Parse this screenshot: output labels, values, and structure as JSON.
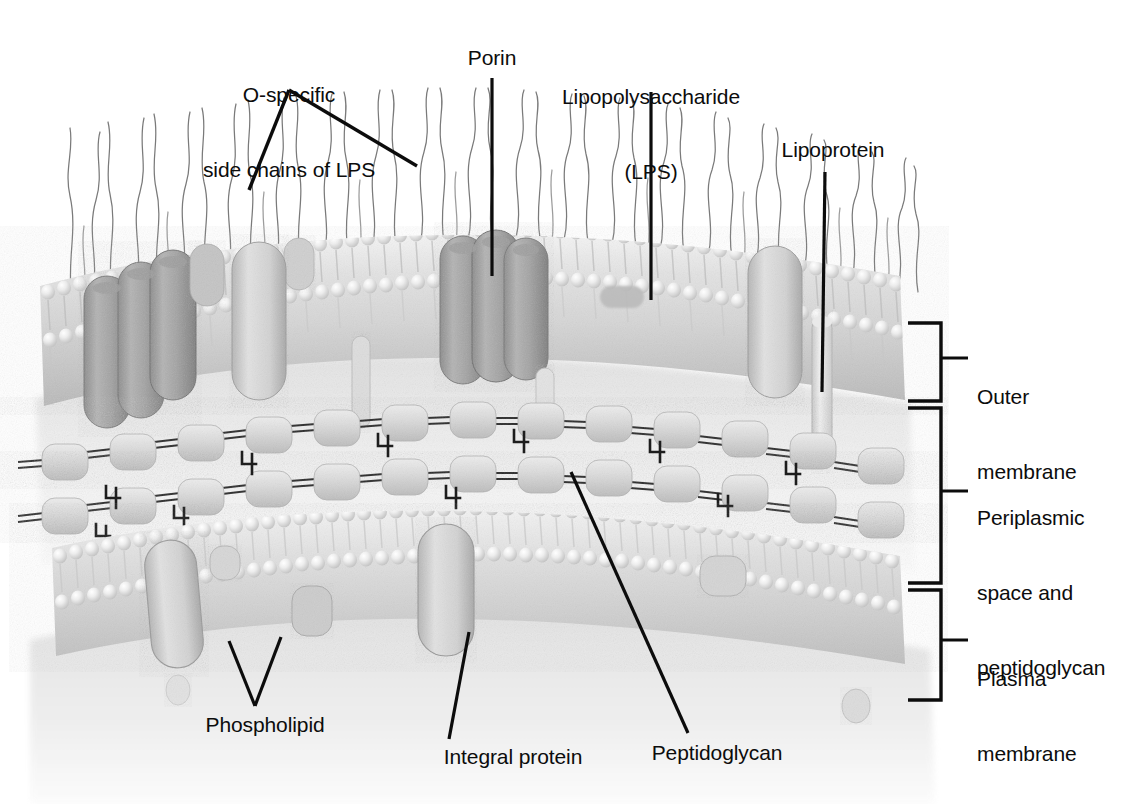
{
  "figure": {
    "type": "biological-illustration",
    "style": "grayscale airbrush rendering",
    "background_color": "#ffffff",
    "ink_color": "#0c0c0c"
  },
  "labels": {
    "o_specific": "O-specific\nside chains of LPS",
    "o_specific_line1": "O-specific",
    "o_specific_line2": "side chains of LPS",
    "porin": "Porin",
    "lps_line1": "Lipopolysaccharide",
    "lps_line2": "(LPS)",
    "lipoprotein": "Lipoprotein",
    "outer_membrane_line1": "Outer",
    "outer_membrane_line2": "membrane",
    "periplasm_line1": "Periplasmic",
    "periplasm_line2": "space and",
    "periplasm_line3": "peptidoglycan",
    "plasma_membrane_line1": "Plasma",
    "plasma_membrane_line2": "membrane",
    "phospholipid": "Phospholipid",
    "integral_protein": "Integral protein",
    "peptidoglycan": "Peptidoglycan"
  },
  "structures": {
    "outer_membrane": "outer membrane bilayer with LPS leaflet",
    "periplasm": "periplasmic space containing peptidoglycan layer",
    "plasma_membrane": "inner plasma membrane phospholipid bilayer",
    "o_antigen_chains": "wavy filaments projecting from outer leaflet",
    "porin_barrels": "dark trimeric barrel proteins spanning outer membrane",
    "lipoprotein_rod": "pale rod anchoring outer membrane to peptidoglycan",
    "peptidoglycan_chains": "two glycan strands of sugar residues with peptide cross-links",
    "integral_proteins": "rounded proteins embedded in plasma membrane",
    "cross_link_glyph": "4"
  },
  "colors": {
    "membrane_light": "#ebebeb",
    "membrane_mid": "#d2d2d2",
    "membrane_shadow": "#b4b4b4",
    "porin_dark": "#9a9a9a",
    "porin_darker": "#848484",
    "peptidoglycan": "#cfcfcf",
    "cytoplasm": "#e4e4e4",
    "hair": "#6b6b6b",
    "leader": "#0c0c0c"
  }
}
